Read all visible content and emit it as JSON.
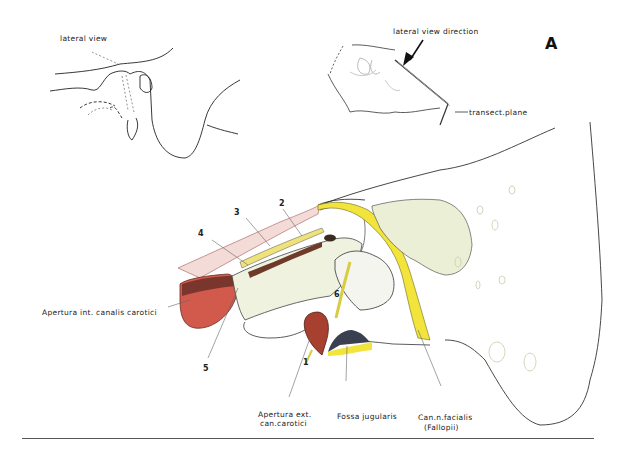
{
  "figure": {
    "plate_letter": "A",
    "inset_left": {
      "label": "lateral view"
    },
    "inset_right": {
      "label_direction": "lateral view direction",
      "label_plane": "transect.plane"
    },
    "numbers": [
      "1",
      "2",
      "3",
      "4",
      "5",
      "6"
    ],
    "labels": {
      "apertura_int": "Apertura  int. canalis carotici",
      "apertura_ext_line1": "Apertura ext.",
      "apertura_ext_line2": "can.carotici",
      "fossa_jugularis": "Fossa  jugularis",
      "can_facialis_line1": "Can.n.facialis",
      "can_facialis_line2": "(Fallopii)"
    },
    "colors": {
      "carotid_red": "#c8473a",
      "facial_canal_yellow": "#f2e43a",
      "bone_green_tint": "#e6ecd2",
      "outline": "#222222"
    }
  }
}
